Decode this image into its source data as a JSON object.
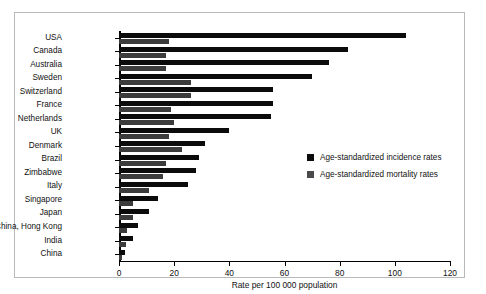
{
  "chart_data": {
    "type": "bar",
    "orientation": "horizontal",
    "title": "",
    "xlabel": "Rate per 100 000 population",
    "ylabel": "",
    "xlim": [
      0,
      120
    ],
    "xticks": [
      0,
      20,
      40,
      60,
      80,
      100,
      120
    ],
    "grid": false,
    "legend_position": "center-right",
    "categories": [
      "USA",
      "Canada",
      "Australia",
      "Sweden",
      "Switzerland",
      "France",
      "Netherlands",
      "UK",
      "Denmark",
      "Brazil",
      "Zimbabwe",
      "Italy",
      "Singapore",
      "Japan",
      "China, Hong Kong",
      "India",
      "China"
    ],
    "series": [
      {
        "name": "Age-standardized incidence rates",
        "color": "#0b0b0b",
        "values": [
          104,
          83,
          76,
          70,
          56,
          56,
          55,
          40,
          31,
          29,
          28,
          25,
          14,
          11,
          7,
          5,
          2
        ]
      },
      {
        "name": "Age-standardized mortality rates",
        "color": "#3c3c3c",
        "values": [
          18,
          17,
          17,
          26,
          26,
          19,
          20,
          18,
          23,
          17,
          16,
          11,
          5,
          5,
          3,
          2.5,
          1
        ]
      }
    ]
  },
  "legend": {
    "items": [
      {
        "label": "Age-standardized incidence rates",
        "swatch": "incidence"
      },
      {
        "label": "Age-standardized mortality rates",
        "swatch": "mortality"
      }
    ]
  },
  "axis": {
    "x_title": "Rate per 100 000 population",
    "x_tick_labels": [
      "0",
      "20",
      "40",
      "60",
      "80",
      "100",
      "120"
    ]
  },
  "colors": {
    "incidence": "#0b0b0b",
    "mortality": "#3c3c3c",
    "frame": "#b9b9b9",
    "axis": "#000000",
    "background": "#ffffff"
  }
}
